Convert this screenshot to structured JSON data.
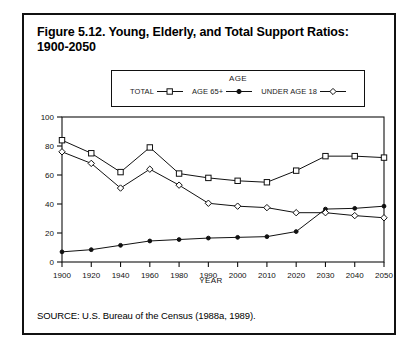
{
  "figure": {
    "title": "Figure 5.12. Young, Elderly, and Total Support Ratios: 1900-2050",
    "source": "SOURCE: U.S. Bureau of the Census (1988a, 1989)."
  },
  "legend": {
    "heading": "AGE",
    "entries": [
      {
        "label": "TOTAL",
        "marker": "square-open-marker"
      },
      {
        "label": "AGE 65+",
        "marker": "dot-solid-marker"
      },
      {
        "label": "UNDER AGE 18",
        "marker": "diamond-open-marker"
      }
    ]
  },
  "chart_data": {
    "type": "line",
    "title": "Figure 5.12. Young, Elderly, and Total Support Ratios: 1900-2050",
    "xlabel": "YEAR",
    "ylabel": "",
    "categories": [
      "1900",
      "1920",
      "1940",
      "1960",
      "1980",
      "1990",
      "2000",
      "2010",
      "2020",
      "2030",
      "2040",
      "2050"
    ],
    "ylim": [
      0,
      100
    ],
    "yticks": [
      0,
      20,
      40,
      60,
      80,
      100
    ],
    "grid": false,
    "legend_position": "above-plot",
    "series": [
      {
        "name": "TOTAL",
        "marker": "square-open-marker",
        "values": [
          84,
          75,
          62,
          79,
          61,
          58,
          56,
          55,
          63,
          73,
          73,
          72
        ]
      },
      {
        "name": "AGE 65+",
        "marker": "dot-solid-marker",
        "values": [
          7,
          8.5,
          11.5,
          14.5,
          15.5,
          16.5,
          17,
          17.5,
          21,
          36.5,
          37,
          38.5
        ]
      },
      {
        "name": "UNDER AGE 18",
        "marker": "diamond-open-marker",
        "values": [
          76,
          68,
          51,
          64,
          53,
          40.5,
          38.5,
          37.5,
          34,
          34,
          32,
          30.5
        ]
      }
    ]
  }
}
